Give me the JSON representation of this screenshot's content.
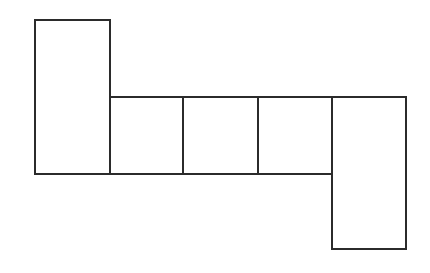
{
  "diagram": {
    "type": "net-of-rectangles",
    "stroke_color": "#2b2b2b",
    "background": "#ffffff",
    "shapes": [
      {
        "id": "left-tall-rect",
        "x": 35,
        "y": 20,
        "w": 75,
        "h": 154
      },
      {
        "id": "middle-square-1",
        "x": 110,
        "y": 97,
        "w": 73,
        "h": 77
      },
      {
        "id": "middle-square-2",
        "x": 183,
        "y": 97,
        "w": 75,
        "h": 77
      },
      {
        "id": "middle-square-3",
        "x": 258,
        "y": 97,
        "w": 74,
        "h": 77
      },
      {
        "id": "right-tall-rect",
        "x": 332,
        "y": 97,
        "w": 74,
        "h": 152
      }
    ]
  }
}
